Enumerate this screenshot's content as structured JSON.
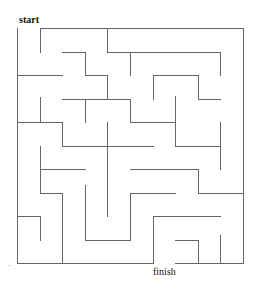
{
  "labels": {
    "start": "start",
    "finish": "finish"
  },
  "colors": {
    "wall": "#666666",
    "background": "#ffffff"
  },
  "maze": {
    "rows": 10,
    "cols": 10,
    "walls": [
      [
        17,
        28,
        17,
        263
      ],
      [
        40,
        28,
        243,
        28
      ],
      [
        40,
        28,
        40,
        52
      ],
      [
        107,
        28,
        107,
        52
      ],
      [
        107,
        52,
        220,
        52
      ],
      [
        243,
        28,
        243,
        263
      ],
      [
        62,
        52,
        85,
        52
      ],
      [
        85,
        52,
        85,
        75
      ],
      [
        85,
        75,
        107,
        75
      ],
      [
        107,
        75,
        107,
        99
      ],
      [
        17,
        75,
        62,
        75
      ],
      [
        130,
        52,
        130,
        75
      ],
      [
        220,
        52,
        220,
        75
      ],
      [
        153,
        75,
        198,
        75
      ],
      [
        153,
        75,
        153,
        99
      ],
      [
        198,
        75,
        198,
        99
      ],
      [
        198,
        99,
        220,
        99
      ],
      [
        175,
        96,
        175,
        99
      ],
      [
        62,
        99,
        130,
        99
      ],
      [
        40,
        97,
        40,
        122
      ],
      [
        85,
        99,
        85,
        122
      ],
      [
        130,
        99,
        130,
        122
      ],
      [
        130,
        122,
        175,
        122
      ],
      [
        175,
        99,
        175,
        146
      ],
      [
        175,
        146,
        220,
        146
      ],
      [
        220,
        122,
        220,
        169
      ],
      [
        17,
        122,
        62,
        122
      ],
      [
        62,
        122,
        62,
        146
      ],
      [
        62,
        146,
        153,
        146
      ],
      [
        107,
        122,
        107,
        180
      ],
      [
        40,
        146,
        40,
        175
      ],
      [
        40,
        169,
        85,
        169
      ],
      [
        130,
        169,
        198,
        169
      ],
      [
        198,
        169,
        198,
        193
      ],
      [
        198,
        193,
        243,
        193
      ],
      [
        40,
        169,
        40,
        193
      ],
      [
        40,
        193,
        62,
        193
      ],
      [
        62,
        193,
        62,
        263
      ],
      [
        17,
        216,
        40,
        216
      ],
      [
        40,
        216,
        40,
        240
      ],
      [
        85,
        185,
        85,
        240
      ],
      [
        85,
        240,
        130,
        240
      ],
      [
        107,
        165,
        107,
        216
      ],
      [
        130,
        193,
        130,
        240
      ],
      [
        130,
        193,
        175,
        193
      ],
      [
        153,
        216,
        220,
        216
      ],
      [
        153,
        216,
        153,
        263
      ],
      [
        175,
        240,
        198,
        240
      ],
      [
        198,
        240,
        198,
        263
      ],
      [
        220,
        235,
        220,
        263
      ],
      [
        17,
        263,
        153,
        263
      ],
      [
        175,
        263,
        243,
        263
      ]
    ]
  }
}
